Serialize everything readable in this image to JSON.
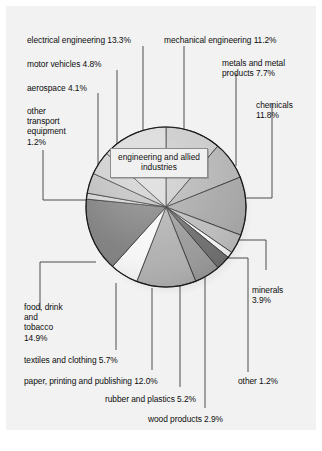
{
  "figure": {
    "center_callout": "engineering and\nallied industries",
    "background_color": "#f2f2f2",
    "page_color": "#ffffff",
    "outline_color": "#1a1a1a",
    "leader_color": "#3b3b3b"
  },
  "chart_data": {
    "type": "pie",
    "title": "",
    "subtitle": "",
    "xlabel": "",
    "ylabel": "",
    "legend_position": "callouts-around-pie",
    "grid": false,
    "units": "percent",
    "center_group_label": "engineering and allied industries",
    "categories": [
      "mechanical engineering",
      "metals and metal products",
      "chemicals",
      "minerals",
      "other",
      "wood products",
      "rubber and plastics",
      "paper, printing and publishing",
      "textiles and clothing",
      "food, drink and tobacco",
      "other transport equipment",
      "aerospace",
      "motor vehicles",
      "electrical engineering"
    ],
    "values": [
      11.2,
      7.7,
      11.8,
      3.9,
      1.2,
      2.9,
      5.2,
      12.0,
      5.7,
      14.9,
      1.2,
      4.1,
      4.8,
      13.3
    ],
    "slice_colors": [
      "#c9c9c9",
      "#b4b4b4",
      "#a8a8a8",
      "#bcbcbc",
      "#f4f4f4",
      "#6e6e6e",
      "#9a9a9a",
      "#b0b0b0",
      "#f6f6f6",
      "#7e7e7e",
      "#d2d2d2",
      "#bdbdbd",
      "#cccccc",
      "#d8d8d8"
    ]
  },
  "labels": {
    "electrical_engineering": "electrical engineering 13.3%",
    "mechanical_engineering": "mechanical engineering 11.2%",
    "motor_vehicles": "motor vehicles 4.8%",
    "metals_and_metal_products": "metals and metal\nproducts 7.7%",
    "aerospace": "aerospace 4.1%",
    "chemicals": "chemicals\n11.8%",
    "other_transport_equipment": "other\ntransport\nequipment\n1.2%",
    "minerals": "minerals\n3.9%",
    "food_drink_and_tobacco": "food, drink\nand\ntobacco\n14.9%",
    "textiles_and_clothing": "textiles and clothing 5.7%",
    "paper_printing_and_publishing": "paper, printing and publishing 12.0%",
    "other": "other 1.2%",
    "rubber_and_plastics": "rubber and plastics 5.2%",
    "wood_products": "wood products 2.9%"
  }
}
